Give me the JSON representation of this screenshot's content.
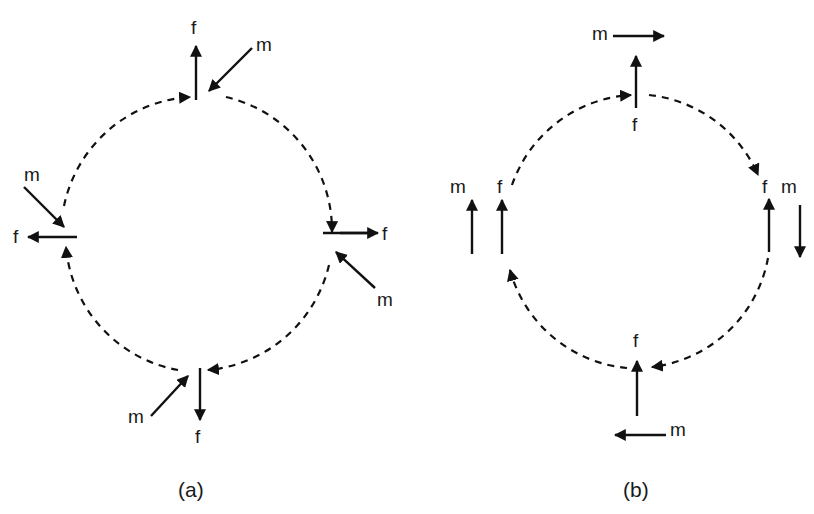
{
  "figure": {
    "panels": [
      {
        "id": "a",
        "caption": "(a)",
        "circle": {
          "cx": 196,
          "cy": 235,
          "r": 137,
          "style": "dashed",
          "direction": "clockwise"
        },
        "positions": [
          {
            "name": "top",
            "f_label": "f",
            "f_direction": "up",
            "m_label": "m",
            "m_direction": "down-left (toward center)"
          },
          {
            "name": "right",
            "f_label": "f",
            "f_direction": "right",
            "m_label": "m",
            "m_direction": "up-left (toward center)"
          },
          {
            "name": "bottom",
            "f_label": "f",
            "f_direction": "down",
            "m_label": "m",
            "m_direction": "up-right (toward center)"
          },
          {
            "name": "left",
            "f_label": "f",
            "f_direction": "left",
            "m_label": "m",
            "m_direction": "down-right (toward center)"
          }
        ]
      },
      {
        "id": "b",
        "caption": "(b)",
        "circle": {
          "cx": 636,
          "cy": 232,
          "r": 134,
          "style": "dashed",
          "direction": "clockwise"
        },
        "positions": [
          {
            "name": "top",
            "f_label": "f",
            "f_direction": "up",
            "m_label": "m",
            "m_direction": "right"
          },
          {
            "name": "right",
            "f_label": "f",
            "f_direction": "up",
            "m_label": "m",
            "m_direction": "down"
          },
          {
            "name": "bottom",
            "f_label": "f",
            "f_direction": "up",
            "m_label": "m",
            "m_direction": "left"
          },
          {
            "name": "left",
            "f_label": "f",
            "f_direction": "up",
            "m_label": "m",
            "m_direction": "up"
          }
        ]
      }
    ],
    "labels": {
      "f": "f",
      "m": "m"
    }
  }
}
